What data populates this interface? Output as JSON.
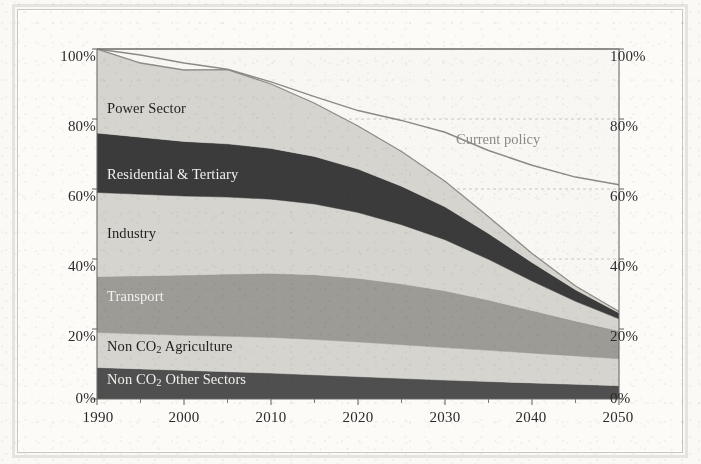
{
  "chart_data": {
    "type": "area",
    "title": "",
    "subtitle": "",
    "xlabel": "",
    "ylabel": "",
    "xlim": [
      1990,
      2050
    ],
    "ylim": [
      0,
      100
    ],
    "grid": true,
    "stacked": true,
    "normalized_percent": true,
    "legend_position": "in-plot-labels",
    "x": [
      1990,
      1995,
      2000,
      2005,
      2010,
      2015,
      2020,
      2025,
      2030,
      2035,
      2040,
      2045,
      2050
    ],
    "y_ticks": [
      "0%",
      "20%",
      "40%",
      "60%",
      "80%",
      "100%"
    ],
    "y_tick_values": [
      0,
      20,
      40,
      60,
      80,
      100
    ],
    "x_ticks": [
      "1990",
      "2000",
      "2010",
      "2020",
      "2030",
      "2040",
      "2050"
    ],
    "x_tick_values": [
      1990,
      2000,
      2010,
      2020,
      2030,
      2040,
      2050
    ],
    "x_minor_tick_values": [
      1995,
      2005,
      2015,
      2025,
      2035,
      2045
    ],
    "series": [
      {
        "name": "Non CO2 Other Sectors",
        "label": "Non CO",
        "label_sub": "2",
        "label_tail": " Other Sectors",
        "color": "#4f4f4f",
        "label_color": "light",
        "values": [
          9.0,
          8.6,
          8.2,
          7.8,
          7.4,
          6.9,
          6.4,
          5.9,
          5.4,
          5.0,
          4.6,
          4.2,
          3.8
        ]
      },
      {
        "name": "Non CO2 Agriculture",
        "label": "Non CO",
        "label_sub": "2",
        "label_tail": " Agriculture",
        "color": "#d6d4cf",
        "label_color": "dark",
        "values": [
          10.0,
          10.0,
          10.0,
          10.1,
          10.2,
          10.1,
          9.9,
          9.6,
          9.3,
          8.9,
          8.5,
          8.1,
          7.7
        ]
      },
      {
        "name": "Transport",
        "label": "Transport",
        "label_sub": "",
        "label_tail": "",
        "color": "#9d9b96",
        "label_color": "light",
        "values": [
          16.0,
          16.6,
          17.2,
          17.8,
          18.3,
          18.5,
          18.2,
          17.4,
          16.2,
          14.4,
          12.2,
          10.0,
          8.0
        ]
      },
      {
        "name": "Industry",
        "label": "Industry",
        "label_sub": "",
        "label_tail": "",
        "color": "#d6d4cf",
        "label_color": "dark",
        "values": [
          24.0,
          23.3,
          22.6,
          22.0,
          21.2,
          20.2,
          18.8,
          16.9,
          14.6,
          11.6,
          8.4,
          5.6,
          3.4
        ]
      },
      {
        "name": "Residential & Tertiary",
        "label": "Residential & Tertiary",
        "label_sub": "",
        "label_tail": "",
        "color": "#3b3b3b",
        "label_color": "light",
        "values": [
          17.0,
          16.3,
          15.6,
          15.2,
          14.5,
          13.6,
          12.4,
          11.0,
          9.4,
          7.4,
          5.3,
          3.3,
          1.7
        ]
      },
      {
        "name": "Power Sector",
        "label": "Power Sector",
        "label_sub": "",
        "label_tail": "",
        "color": "#d6d4cf",
        "label_color": "dark",
        "values": [
          24.0,
          21.2,
          20.4,
          21.2,
          18.4,
          15.2,
          12.3,
          9.9,
          7.3,
          4.8,
          2.6,
          1.1,
          0.4
        ]
      }
    ],
    "stack_totals": [
      100.0,
      96.0,
      94.0,
      94.1,
      90.0,
      84.5,
      78.0,
      70.7,
      62.2,
      52.1,
      41.6,
      32.3,
      25.0
    ],
    "overlay_line": {
      "name": "Current policy",
      "label": "Current policy",
      "color": "#8c8a85",
      "values": [
        100.0,
        98.3,
        96.0,
        94.2,
        90.6,
        86.4,
        82.4,
        79.6,
        76.2,
        71.0,
        66.8,
        63.4,
        61.2
      ]
    },
    "axis_color": "#6d6b66",
    "grid_color": "#c4c2bc",
    "text_color": "#2b2b2b"
  }
}
